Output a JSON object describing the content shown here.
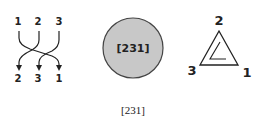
{
  "braid": {
    "top_labels": [
      "1",
      "2",
      "3"
    ],
    "bottom_labels": [
      "2",
      "3",
      "1"
    ]
  },
  "circle": {
    "label": "[231]",
    "fill": "#c8c8c8",
    "stroke": "#444444"
  },
  "triangle": {
    "vertex_top": "2",
    "vertex_left": "3",
    "vertex_right": "1"
  },
  "caption": "[231]"
}
